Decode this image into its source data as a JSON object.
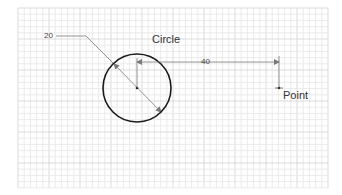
{
  "sketch": {
    "colors": {
      "background": "#ffffff",
      "grid_minor": "#e6e6e6",
      "grid_major": "#d2d2d2",
      "geometry": "#1a1a1a",
      "dimension": "#7a7a7a"
    },
    "grid": {
      "x_start": 18,
      "x_end": 328,
      "y_start": 8,
      "y_end": 188,
      "minor_spacing": 6.2,
      "major_every": 5
    },
    "circle": {
      "label": "Circle",
      "center_x": 137,
      "center_y": 88,
      "radius": 34
    },
    "point": {
      "label": "Point",
      "x": 279,
      "y": 88
    },
    "dimensions": {
      "diameter": {
        "value": "20"
      },
      "distance": {
        "value": "40"
      }
    }
  }
}
